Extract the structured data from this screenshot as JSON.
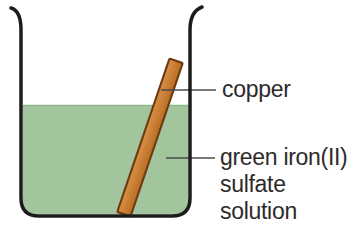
{
  "figure": {
    "labels": {
      "copper": "copper",
      "solution_line1": "green iron(II)",
      "solution_line2": "sulfate",
      "solution_line3": "solution"
    },
    "colors": {
      "solution_green": "#a2c59e",
      "solution_surface": "#8fb78b",
      "copper_light": "#d89048",
      "copper_dark": "#b96d22",
      "copper_border": "#6e3b12",
      "beaker_outline": "#1c1c1c",
      "leader_line": "#4a4a4a",
      "text": "#2d2a2b"
    }
  }
}
